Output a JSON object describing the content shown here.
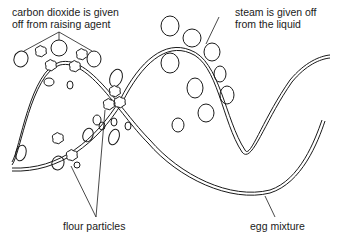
{
  "labels": {
    "co2": [
      "carbon dioxide is given",
      "off from raising agent"
    ],
    "steam": [
      "steam is given off",
      "from the liquid"
    ],
    "flour": "flour particles",
    "egg": "egg mixture"
  },
  "colors": {
    "line": "#1a1a1a",
    "background": "#ffffff"
  }
}
